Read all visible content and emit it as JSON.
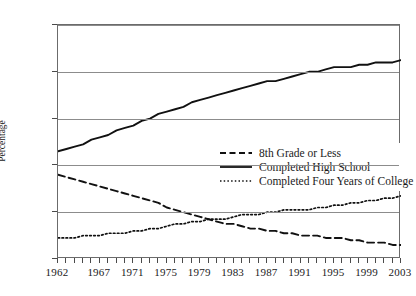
{
  "chart_data": {
    "type": "line",
    "title": "",
    "xlabel": "",
    "ylabel": "Percentage",
    "xlim": [
      1962,
      2003
    ],
    "ylim": [
      0,
      100
    ],
    "grid": true,
    "legend_position": "inside-center-right",
    "x": [
      1962,
      1963,
      1964,
      1965,
      1966,
      1967,
      1968,
      1969,
      1970,
      1971,
      1972,
      1973,
      1974,
      1975,
      1976,
      1977,
      1978,
      1979,
      1980,
      1981,
      1982,
      1983,
      1984,
      1985,
      1986,
      1987,
      1988,
      1989,
      1990,
      1991,
      1992,
      1993,
      1994,
      1995,
      1996,
      1997,
      1998,
      1999,
      2000,
      2001,
      2002,
      2003
    ],
    "xticks": [
      1962,
      1967,
      1971,
      1975,
      1979,
      1983,
      1987,
      1991,
      1995,
      1999,
      2003
    ],
    "yticks": [
      0,
      20,
      40,
      60,
      80,
      100
    ],
    "series": [
      {
        "name": "8th Grade or Less",
        "style": "dashed",
        "color": "#111111",
        "values": [
          36,
          35,
          34,
          33,
          32,
          31,
          30,
          29,
          28,
          27,
          26,
          25,
          24,
          22,
          21,
          20,
          19,
          18,
          17,
          16,
          15,
          15,
          14,
          13,
          13,
          12,
          12,
          11,
          11,
          10,
          10,
          10,
          9,
          9,
          9,
          8,
          8,
          7,
          7,
          7,
          6,
          6
        ]
      },
      {
        "name": "Completed High School",
        "style": "solid",
        "color": "#111111",
        "values": [
          46,
          47,
          48,
          49,
          51,
          52,
          53,
          55,
          56,
          57,
          59,
          60,
          62,
          63,
          64,
          65,
          67,
          68,
          69,
          70,
          71,
          72,
          73,
          74,
          75,
          76,
          76,
          77,
          78,
          79,
          80,
          80,
          81,
          82,
          82,
          82,
          83,
          83,
          84,
          84,
          84,
          85
        ]
      },
      {
        "name": "Completed Four Years of College",
        "style": "dotted",
        "color": "#111111",
        "values": [
          9,
          9,
          9,
          10,
          10,
          10,
          11,
          11,
          11,
          12,
          12,
          13,
          13,
          14,
          15,
          15,
          16,
          16,
          17,
          17,
          17,
          18,
          19,
          19,
          19,
          20,
          20,
          21,
          21,
          21,
          21,
          22,
          22,
          23,
          23,
          24,
          24,
          25,
          25,
          26,
          26,
          27
        ]
      }
    ]
  },
  "axes": {
    "ylabel": "Percentage",
    "ytick_labels": [
      "0",
      "20",
      "40",
      "60",
      "80",
      "100"
    ],
    "xtick_labels": [
      "1962",
      "1967",
      "1971",
      "1975",
      "1979",
      "1983",
      "1987",
      "1991",
      "1995",
      "1999",
      "2003"
    ]
  },
  "legend": {
    "items": [
      {
        "label": "8th Grade or Less",
        "key": "dashed-line-key"
      },
      {
        "label": "Completed High School",
        "key": "solid-line-key"
      },
      {
        "label": "Completed Four Years of College",
        "key": "dotted-line-key"
      }
    ]
  }
}
